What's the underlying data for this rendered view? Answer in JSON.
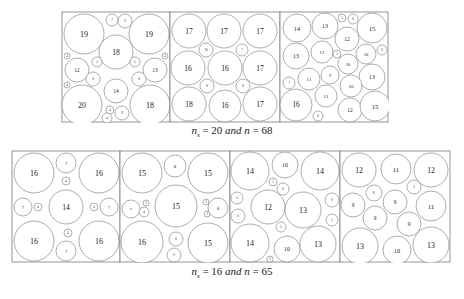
{
  "figure": {
    "top_row": {
      "caption": {
        "ns_label": "n",
        "ns_sub": "s",
        "eq1": " = 20 ",
        "and": "and",
        "n_label": " n",
        "eq2": " = 68"
      },
      "panels": [
        {
          "x": 62,
          "y": 12,
          "w": 108,
          "h": 110,
          "circles": [
            {
              "cx": 22,
              "cy": 22,
              "r": 20,
              "l": "19"
            },
            {
              "cx": 50,
              "cy": 8,
              "r": 6,
              "l": "7"
            },
            {
              "cx": 63,
              "cy": 9,
              "r": 7,
              "l": "9"
            },
            {
              "cx": 87,
              "cy": 22,
              "r": 20,
              "l": "19"
            },
            {
              "cx": 54,
              "cy": 40,
              "r": 17,
              "l": "18"
            },
            {
              "cx": 15,
              "cy": 58,
              "r": 12,
              "l": "12"
            },
            {
              "cx": 35,
              "cy": 50,
              "r": 5,
              "l": "5"
            },
            {
              "cx": 73,
              "cy": 50,
              "r": 5,
              "l": "5"
            },
            {
              "cx": 93,
              "cy": 58,
              "r": 12,
              "l": "13"
            },
            {
              "cx": 31,
              "cy": 67,
              "r": 7,
              "l": "8"
            },
            {
              "cx": 77,
              "cy": 67,
              "r": 7,
              "l": "8"
            },
            {
              "cx": 54,
              "cy": 79,
              "r": 12,
              "l": "14"
            },
            {
              "cx": 20,
              "cy": 93,
              "r": 20,
              "l": "20"
            },
            {
              "cx": 88,
              "cy": 93,
              "r": 20,
              "l": "18"
            },
            {
              "cx": 48,
              "cy": 98,
              "r": 4,
              "l": "4"
            },
            {
              "cx": 45,
              "cy": 106,
              "r": 5,
              "l": "4"
            },
            {
              "cx": 60,
              "cy": 101,
              "r": 7,
              "l": "9"
            },
            {
              "cx": 5,
              "cy": 44,
              "r": 3,
              "l": "4"
            },
            {
              "cx": 5,
              "cy": 73,
              "r": 3,
              "l": "4"
            },
            {
              "cx": 103,
              "cy": 44,
              "r": 3,
              "l": "4"
            }
          ]
        },
        {
          "x": 170,
          "y": 12,
          "w": 110,
          "h": 110,
          "circles": [
            {
              "cx": 19,
              "cy": 19,
              "r": 17,
              "l": "17"
            },
            {
              "cx": 54,
              "cy": 19,
              "r": 17,
              "l": "17"
            },
            {
              "cx": 90,
              "cy": 19,
              "r": 17,
              "l": "17"
            },
            {
              "cx": 36,
              "cy": 38,
              "r": 7,
              "l": "10"
            },
            {
              "cx": 72,
              "cy": 38,
              "r": 6,
              "l": "7"
            },
            {
              "cx": 18,
              "cy": 56,
              "r": 17,
              "l": "16"
            },
            {
              "cx": 55,
              "cy": 56,
              "r": 17,
              "l": "16"
            },
            {
              "cx": 90,
              "cy": 56,
              "r": 17,
              "l": "17"
            },
            {
              "cx": 37,
              "cy": 74,
              "r": 7,
              "l": "8"
            },
            {
              "cx": 73,
              "cy": 74,
              "r": 7,
              "l": "8"
            },
            {
              "cx": 19,
              "cy": 92,
              "r": 17,
              "l": "18"
            },
            {
              "cx": 55,
              "cy": 94,
              "r": 16,
              "l": "16"
            },
            {
              "cx": 90,
              "cy": 92,
              "r": 17,
              "l": "17"
            }
          ]
        },
        {
          "x": 280,
          "y": 12,
          "w": 108,
          "h": 110,
          "circles": [
            {
              "cx": 17,
              "cy": 16,
              "r": 14,
              "l": "14"
            },
            {
              "cx": 45,
              "cy": 14,
              "r": 13,
              "l": "13"
            },
            {
              "cx": 62,
              "cy": 6,
              "r": 4,
              "l": "5"
            },
            {
              "cx": 73,
              "cy": 7,
              "r": 5,
              "l": "6"
            },
            {
              "cx": 92,
              "cy": 16,
              "r": 15,
              "l": "15"
            },
            {
              "cx": 67,
              "cy": 27,
              "r": 12,
              "l": "12"
            },
            {
              "cx": 16,
              "cy": 44,
              "r": 13,
              "l": "13"
            },
            {
              "cx": 42,
              "cy": 40,
              "r": 11,
              "l": "11"
            },
            {
              "cx": 57,
              "cy": 42,
              "r": 4,
              "l": "5"
            },
            {
              "cx": 86,
              "cy": 42,
              "r": 10,
              "l": "10"
            },
            {
              "cx": 102,
              "cy": 38,
              "r": 5,
              "l": "6"
            },
            {
              "cx": 68,
              "cy": 52,
              "r": 10,
              "l": "10"
            },
            {
              "cx": 9,
              "cy": 71,
              "r": 6,
              "l": "7"
            },
            {
              "cx": 29,
              "cy": 67,
              "r": 11,
              "l": "11"
            },
            {
              "cx": 50,
              "cy": 63,
              "r": 9,
              "l": "9"
            },
            {
              "cx": 92,
              "cy": 65,
              "r": 13,
              "l": "13"
            },
            {
              "cx": 71,
              "cy": 74,
              "r": 11,
              "l": "10"
            },
            {
              "cx": 46,
              "cy": 84,
              "r": 11,
              "l": "11"
            },
            {
              "cx": 16,
              "cy": 93,
              "r": 16,
              "l": "16"
            },
            {
              "cx": 70,
              "cy": 98,
              "r": 12,
              "l": "12"
            },
            {
              "cx": 95,
              "cy": 94,
              "r": 15,
              "l": "15"
            },
            {
              "cx": 38,
              "cy": 104,
              "r": 5,
              "l": "6"
            }
          ]
        }
      ]
    },
    "bottom_row": {
      "caption": {
        "ns_label": "n",
        "ns_sub": "s",
        "eq1": " = 16 ",
        "and": "and",
        "n_label": " n",
        "eq2": " = 65"
      },
      "panels": [
        {
          "x": 12,
          "y": 151,
          "w": 108,
          "h": 111,
          "circles": [
            {
              "cx": 22,
              "cy": 22,
              "r": 20,
              "l": "16"
            },
            {
              "cx": 54,
              "cy": 12,
              "r": 10,
              "l": "7"
            },
            {
              "cx": 87,
              "cy": 22,
              "r": 20,
              "l": "16"
            },
            {
              "cx": 54,
              "cy": 30,
              "r": 4,
              "l": "4"
            },
            {
              "cx": 11,
              "cy": 56,
              "r": 9,
              "l": "7"
            },
            {
              "cx": 26,
              "cy": 56,
              "r": 4,
              "l": "4"
            },
            {
              "cx": 54,
              "cy": 56,
              "r": 17,
              "l": "14"
            },
            {
              "cx": 82,
              "cy": 56,
              "r": 4,
              "l": "4"
            },
            {
              "cx": 97,
              "cy": 56,
              "r": 9,
              "l": "7"
            },
            {
              "cx": 22,
              "cy": 90,
              "r": 20,
              "l": "16"
            },
            {
              "cx": 56,
              "cy": 82,
              "r": 4,
              "l": "4"
            },
            {
              "cx": 54,
              "cy": 100,
              "r": 10,
              "l": "7"
            },
            {
              "cx": 87,
              "cy": 90,
              "r": 20,
              "l": "16"
            }
          ]
        },
        {
          "x": 120,
          "y": 151,
          "w": 110,
          "h": 111,
          "circles": [
            {
              "cx": 22,
              "cy": 22,
              "r": 20,
              "l": "15"
            },
            {
              "cx": 55,
              "cy": 15,
              "r": 11,
              "l": "8"
            },
            {
              "cx": 88,
              "cy": 22,
              "r": 20,
              "l": "15"
            },
            {
              "cx": 11,
              "cy": 58,
              "r": 9,
              "l": "7"
            },
            {
              "cx": 26,
              "cy": 52,
              "r": 3,
              "l": "3"
            },
            {
              "cx": 24,
              "cy": 61,
              "r": 5,
              "l": "4"
            },
            {
              "cx": 56,
              "cy": 55,
              "r": 21,
              "l": "15"
            },
            {
              "cx": 86,
              "cy": 51,
              "r": 3,
              "l": "3"
            },
            {
              "cx": 87,
              "cy": 63,
              "r": 3,
              "l": "3"
            },
            {
              "cx": 98,
              "cy": 57,
              "r": 10,
              "l": "8"
            },
            {
              "cx": 22,
              "cy": 91,
              "r": 21,
              "l": "16"
            },
            {
              "cx": 56,
              "cy": 88,
              "r": 7,
              "l": "6"
            },
            {
              "cx": 54,
              "cy": 104,
              "r": 7,
              "l": "6"
            },
            {
              "cx": 88,
              "cy": 92,
              "r": 20,
              "l": "15"
            }
          ]
        },
        {
          "x": 230,
          "y": 151,
          "w": 110,
          "h": 111,
          "circles": [
            {
              "cx": 20,
              "cy": 20,
              "r": 19,
              "l": "14"
            },
            {
              "cx": 55,
              "cy": 14,
              "r": 13,
              "l": "10"
            },
            {
              "cx": 90,
              "cy": 20,
              "r": 19,
              "l": "14"
            },
            {
              "cx": 43,
              "cy": 31,
              "r": 4,
              "l": "5"
            },
            {
              "cx": 53,
              "cy": 38,
              "r": 6,
              "l": "6"
            },
            {
              "cx": 7,
              "cy": 47,
              "r": 6,
              "l": "5"
            },
            {
              "cx": 8,
              "cy": 65,
              "r": 7,
              "l": "6"
            },
            {
              "cx": 38,
              "cy": 56,
              "r": 17,
              "l": "12"
            },
            {
              "cx": 73,
              "cy": 59,
              "r": 18,
              "l": "13"
            },
            {
              "cx": 102,
              "cy": 49,
              "r": 7,
              "l": "6"
            },
            {
              "cx": 102,
              "cy": 69,
              "r": 6,
              "l": "5"
            },
            {
              "cx": 51,
              "cy": 76,
              "r": 5,
              "l": "5"
            },
            {
              "cx": 20,
              "cy": 92,
              "r": 19,
              "l": "14"
            },
            {
              "cx": 57,
              "cy": 98,
              "r": 13,
              "l": "10"
            },
            {
              "cx": 88,
              "cy": 93,
              "r": 18,
              "l": "13"
            },
            {
              "cx": 40,
              "cy": 108,
              "r": 3,
              "l": "3"
            }
          ]
        },
        {
          "x": 340,
          "y": 151,
          "w": 110,
          "h": 111,
          "circles": [
            {
              "cx": 19,
              "cy": 19,
              "r": 17,
              "l": "12"
            },
            {
              "cx": 56,
              "cy": 18,
              "r": 15,
              "l": "11"
            },
            {
              "cx": 91,
              "cy": 19,
              "r": 17,
              "l": "12"
            },
            {
              "cx": 34,
              "cy": 42,
              "r": 8,
              "l": "6"
            },
            {
              "cx": 74,
              "cy": 36,
              "r": 7,
              "l": "5"
            },
            {
              "cx": 13,
              "cy": 54,
              "r": 12,
              "l": "9"
            },
            {
              "cx": 55,
              "cy": 51,
              "r": 12,
              "l": "9"
            },
            {
              "cx": 91,
              "cy": 55,
              "r": 15,
              "l": "11"
            },
            {
              "cx": 35,
              "cy": 67,
              "r": 12,
              "l": "9"
            },
            {
              "cx": 69,
              "cy": 73,
              "r": 12,
              "l": "9"
            },
            {
              "cx": 20,
              "cy": 95,
              "r": 18,
              "l": "13"
            },
            {
              "cx": 57,
              "cy": 99,
              "r": 14,
              "l": "10"
            },
            {
              "cx": 91,
              "cy": 94,
              "r": 18,
              "l": "13"
            }
          ]
        }
      ]
    }
  }
}
